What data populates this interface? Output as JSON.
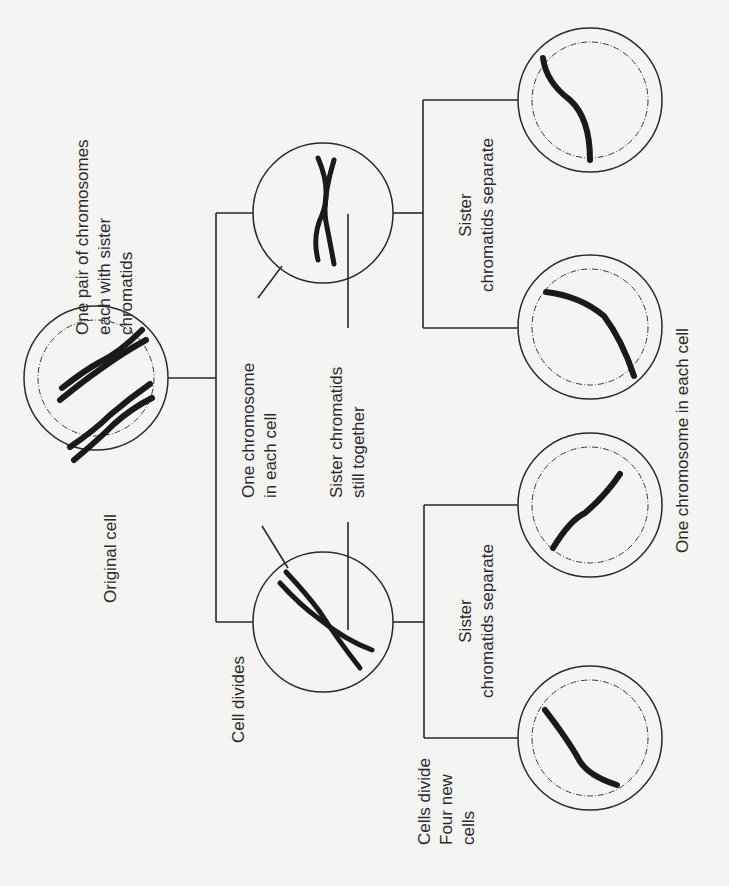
{
  "diagram": {
    "orientation": "rotated 90deg counter-clockwise",
    "colors": {
      "background": "#f4f4f2",
      "ink": "#2a2a2a"
    },
    "labels": {
      "original_cell": "Original cell",
      "pair_desc_1": "One pair of chromosomes",
      "pair_desc_2": "each with sister",
      "pair_desc_3": "chromatids",
      "cell_divides": "Cell divides",
      "one_chrom_1": "One chromosome",
      "one_chrom_2": "in each cell",
      "sister_together_1": "Sister chromatids",
      "sister_together_2": "still together",
      "sister_sep_top_1": "Sister",
      "sister_sep_top_2": "chromatids separate",
      "sister_sep_bottom_1": "Sister",
      "sister_sep_bottom_2": "chromatids separate",
      "cells_divide_1": "Cells divide",
      "cells_divide_2": "Four new",
      "cells_divide_3": "cells",
      "final": "One chromosome in each cell"
    },
    "stages": [
      {
        "name": "original-cell",
        "cells": 1,
        "chromosomes_per_cell": "1 pair (2 chromosomes, each with sister chromatids)"
      },
      {
        "name": "first-division",
        "cells": 2,
        "chromosomes_per_cell": "1 chromosome (sister chromatids together)"
      },
      {
        "name": "second-division",
        "cells": 4,
        "chromosomes_per_cell": "1 chromosome (single chromatid)"
      }
    ]
  }
}
